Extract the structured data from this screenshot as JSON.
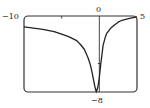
{
  "chart_data": {
    "type": "line",
    "title": "",
    "xlabel": "",
    "ylabel": "",
    "xlim": [
      -10,
      5
    ],
    "ylim": [
      -8,
      0
    ],
    "grid": false,
    "legend": null,
    "tick_labels": {
      "x_min": "−10",
      "x_zero": "0",
      "x_max": "5",
      "y_min": "−8"
    },
    "x_ticks": [
      -5
    ],
    "y_ticks": [
      -5
    ],
    "series": [
      {
        "name": "f(x)",
        "x": [
          -10,
          -8.5,
          -7.5,
          -6,
          -5,
          -4,
          -3,
          -2.5,
          -2,
          -1.5,
          -1.2,
          -1,
          -0.8,
          -0.6,
          -0.4,
          -0.2,
          0,
          0.2,
          0.5,
          0.8,
          1,
          1.5,
          2,
          2.5,
          3,
          4,
          5
        ],
        "y": [
          -1.15,
          -1.3,
          -1.4,
          -1.65,
          -1.9,
          -2.2,
          -2.6,
          -3.0,
          -3.5,
          -4.4,
          -5.1,
          -5.8,
          -6.6,
          -7.4,
          -8.0,
          -7.5,
          -6.5,
          -5.0,
          -3.1,
          -2.2,
          -1.8,
          -1.3,
          -0.95,
          -0.65,
          -0.45,
          -0.25,
          -0.1
        ]
      }
    ]
  }
}
